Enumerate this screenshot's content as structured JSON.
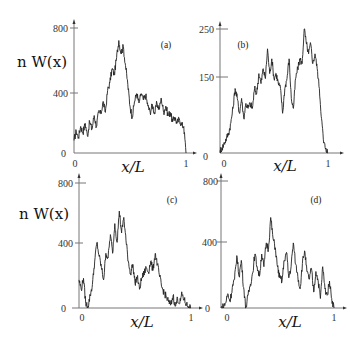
{
  "figure": {
    "ylabel_text": "n W(x)",
    "xlabel_text": "x/L"
  },
  "chart_data": [
    {
      "type": "line",
      "panel": "(a)",
      "title": "(a)",
      "xlabel": "x/L",
      "ylabel": "n W(x)",
      "xlim": [
        0,
        1
      ],
      "ylim": [
        0,
        800
      ],
      "yticks": [
        0,
        400,
        800
      ],
      "ytick_labels": [
        "0",
        "400",
        "800"
      ],
      "xticks": [
        0,
        1
      ],
      "xtick_labels": [
        "0",
        "1"
      ],
      "grid": false,
      "x": [
        0,
        0.02,
        0.04,
        0.06,
        0.08,
        0.1,
        0.12,
        0.14,
        0.16,
        0.18,
        0.2,
        0.22,
        0.24,
        0.26,
        0.28,
        0.3,
        0.32,
        0.34,
        0.36,
        0.38,
        0.4,
        0.42,
        0.44,
        0.46,
        0.48,
        0.5,
        0.52,
        0.54,
        0.56,
        0.58,
        0.6,
        0.62,
        0.64,
        0.66,
        0.68,
        0.7,
        0.72,
        0.74,
        0.76,
        0.78,
        0.8,
        0.82,
        0.84,
        0.86,
        0.88,
        0.9,
        0.92,
        0.94,
        0.96,
        0.98,
        1.0
      ],
      "values": [
        80,
        140,
        100,
        170,
        130,
        190,
        110,
        200,
        150,
        240,
        170,
        260,
        250,
        330,
        260,
        400,
        450,
        540,
        500,
        610,
        720,
        640,
        680,
        560,
        440,
        300,
        230,
        330,
        380,
        320,
        380,
        340,
        370,
        300,
        260,
        310,
        250,
        320,
        280,
        350,
        260,
        300,
        240,
        260,
        200,
        230,
        190,
        220,
        180,
        170,
        0
      ]
    },
    {
      "type": "line",
      "panel": "(b)",
      "title": "(b)",
      "xlabel": "x/L",
      "ylabel": "",
      "xlim": [
        0,
        1
      ],
      "ylim": [
        0,
        250
      ],
      "yticks": [
        0,
        150,
        250
      ],
      "ytick_labels": [
        "0",
        "150",
        "250"
      ],
      "xticks": [
        0,
        1
      ],
      "xtick_labels": [
        "0",
        "1"
      ],
      "grid": false,
      "x": [
        0,
        0.02,
        0.04,
        0.06,
        0.08,
        0.1,
        0.12,
        0.14,
        0.16,
        0.18,
        0.2,
        0.22,
        0.24,
        0.26,
        0.28,
        0.3,
        0.32,
        0.34,
        0.36,
        0.38,
        0.4,
        0.42,
        0.44,
        0.46,
        0.48,
        0.5,
        0.52,
        0.54,
        0.56,
        0.58,
        0.6,
        0.62,
        0.64,
        0.66,
        0.68,
        0.7,
        0.72,
        0.74,
        0.76,
        0.78,
        0.8,
        0.82,
        0.84,
        0.86,
        0.88,
        0.9,
        0.92,
        0.94,
        0.96,
        0.98,
        1.0
      ],
      "values": [
        5,
        10,
        20,
        30,
        40,
        60,
        90,
        130,
        110,
        80,
        110,
        70,
        100,
        90,
        100,
        90,
        130,
        120,
        160,
        140,
        170,
        150,
        210,
        160,
        190,
        150,
        160,
        140,
        130,
        80,
        130,
        150,
        190,
        110,
        90,
        150,
        170,
        190,
        180,
        250,
        220,
        200,
        220,
        180,
        200,
        170,
        130,
        70,
        20,
        10,
        0
      ]
    },
    {
      "type": "line",
      "panel": "(c)",
      "title": "(c)",
      "xlabel": "x/L",
      "ylabel": "n W(x)",
      "xlim": [
        0,
        1
      ],
      "ylim": [
        0,
        800
      ],
      "yticks": [
        0,
        400,
        800
      ],
      "ytick_labels": [
        "0",
        "400",
        "800"
      ],
      "xticks": [
        0,
        1
      ],
      "xtick_labels": [
        "0",
        "1"
      ],
      "grid": false,
      "x": [
        0,
        0.02,
        0.04,
        0.06,
        0.08,
        0.1,
        0.12,
        0.14,
        0.16,
        0.18,
        0.2,
        0.22,
        0.24,
        0.26,
        0.28,
        0.3,
        0.32,
        0.34,
        0.36,
        0.38,
        0.4,
        0.42,
        0.44,
        0.46,
        0.48,
        0.5,
        0.52,
        0.54,
        0.56,
        0.58,
        0.6,
        0.62,
        0.64,
        0.66,
        0.68,
        0.7,
        0.72,
        0.74,
        0.76,
        0.78,
        0.8,
        0.82,
        0.84,
        0.86,
        0.88,
        0.9,
        0.92,
        0.94,
        0.96,
        0.98,
        1.0
      ],
      "values": [
        180,
        120,
        190,
        30,
        10,
        80,
        150,
        300,
        420,
        330,
        260,
        180,
        350,
        320,
        470,
        350,
        540,
        420,
        620,
        480,
        580,
        430,
        300,
        220,
        280,
        160,
        200,
        120,
        190,
        220,
        260,
        230,
        300,
        240,
        350,
        280,
        200,
        130,
        100,
        70,
        40,
        20,
        80,
        10,
        60,
        30,
        90,
        50,
        20,
        10,
        0
      ]
    },
    {
      "type": "line",
      "panel": "(d)",
      "title": "(d)",
      "xlabel": "x/L",
      "ylabel": "",
      "xlim": [
        0,
        1
      ],
      "ylim": [
        0,
        800
      ],
      "yticks": [
        0,
        400,
        800
      ],
      "ytick_labels": [
        "0",
        "400",
        "800"
      ],
      "xticks": [
        0,
        1
      ],
      "xtick_labels": [
        "0",
        "1"
      ],
      "grid": false,
      "x": [
        0,
        0.02,
        0.04,
        0.06,
        0.08,
        0.1,
        0.12,
        0.14,
        0.16,
        0.18,
        0.2,
        0.22,
        0.24,
        0.26,
        0.28,
        0.3,
        0.32,
        0.34,
        0.36,
        0.38,
        0.4,
        0.42,
        0.44,
        0.46,
        0.48,
        0.5,
        0.52,
        0.54,
        0.56,
        0.58,
        0.6,
        0.62,
        0.64,
        0.66,
        0.68,
        0.7,
        0.72,
        0.74,
        0.76,
        0.78,
        0.8,
        0.82,
        0.84,
        0.86,
        0.88,
        0.9,
        0.92,
        0.94,
        0.96,
        0.98,
        1.0
      ],
      "values": [
        0,
        10,
        30,
        90,
        40,
        130,
        180,
        330,
        200,
        300,
        130,
        0,
        80,
        150,
        220,
        340,
        260,
        200,
        340,
        260,
        410,
        370,
        570,
        440,
        380,
        260,
        190,
        170,
        300,
        350,
        190,
        260,
        410,
        280,
        200,
        120,
        280,
        360,
        230,
        180,
        250,
        100,
        230,
        170,
        60,
        260,
        120,
        80,
        170,
        60,
        0
      ]
    }
  ],
  "panels": [
    {
      "tag": "(a)",
      "ytick_labels": [
        "0",
        "400",
        "800"
      ],
      "xtick0": "0",
      "xtick1": "1",
      "ylabel": "n W(x)",
      "xlabel": "x/L"
    },
    {
      "tag": "(b)",
      "ytick_labels": [
        "0",
        "150",
        "250"
      ],
      "xtick0": "0",
      "xtick1": "1",
      "ylabel": "",
      "xlabel": "x/L"
    },
    {
      "tag": "(c)",
      "ytick_labels": [
        "0",
        "400",
        "800"
      ],
      "xtick0": "0",
      "xtick1": "1",
      "ylabel": "n W(x)",
      "xlabel": "x/L"
    },
    {
      "tag": "(d)",
      "ytick_labels": [
        "0",
        "400",
        "800"
      ],
      "xtick0": "0",
      "xtick1": "1",
      "ylabel": "",
      "xlabel": "x/L"
    }
  ]
}
